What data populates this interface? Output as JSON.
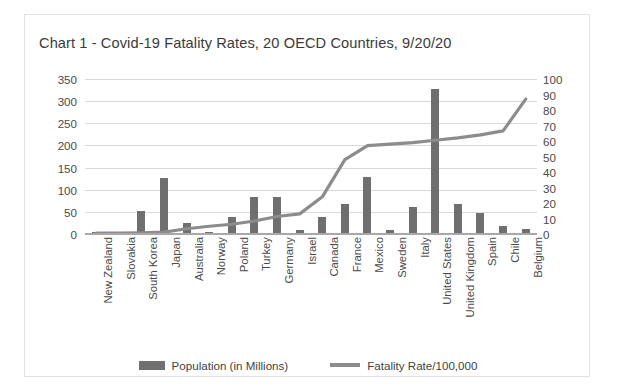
{
  "chart_data": {
    "type": "bar",
    "title": "Chart 1 - Covid-19 Fatality Rates, 20 OECD Countries, 9/20/20",
    "xlabel": "",
    "ylabel": "",
    "grid": true,
    "legend_position": "bottom",
    "categories": [
      "New Zealand",
      "Slovakia",
      "South Korea",
      "Japan",
      "Australia",
      "Norway",
      "Poland",
      "Turkey",
      "Germany",
      "Israel",
      "Canada",
      "France",
      "Mexico",
      "Sweden",
      "Italy",
      "United States",
      "United Kingdom",
      "Spain",
      "Chile",
      "Belgium"
    ],
    "series": [
      {
        "name": "Population (in Millions)",
        "type": "bar",
        "axis": "left",
        "color": "#6f6f6f",
        "values": [
          5,
          5,
          52,
          126,
          25,
          5,
          38,
          84,
          83,
          9,
          38,
          67,
          129,
          10,
          60,
          328,
          68,
          47,
          19,
          12
        ]
      },
      {
        "name": "Fatality Rate/100,000",
        "type": "line",
        "axis": "right",
        "color": "#8c8c8c",
        "values": [
          0.5,
          0.6,
          0.8,
          1.2,
          3.4,
          5.0,
          6.3,
          8.4,
          11.3,
          13.0,
          24.0,
          48.0,
          57.0,
          58.0,
          59.0,
          60.5,
          62.0,
          64.0,
          66.5,
          87.0
        ]
      }
    ],
    "y_left": {
      "label": "",
      "min": 0,
      "max": 350,
      "step": 50,
      "ticks": [
        0,
        50,
        100,
        150,
        200,
        250,
        300,
        350
      ]
    },
    "y_right": {
      "label": "",
      "min": 0,
      "max": 100,
      "step": 10,
      "ticks": [
        0,
        10,
        20,
        30,
        40,
        50,
        60,
        70,
        80,
        90,
        100
      ]
    }
  },
  "legend": {
    "bar_label": "Population (in Millions)",
    "line_label": "Fatality Rate/100,000"
  },
  "colors": {
    "bar": "#6f6f6f",
    "line": "#8c8c8c",
    "grid": "#d9d9d9",
    "text": "#3a3a3a",
    "frame": "#e2e2e2"
  }
}
